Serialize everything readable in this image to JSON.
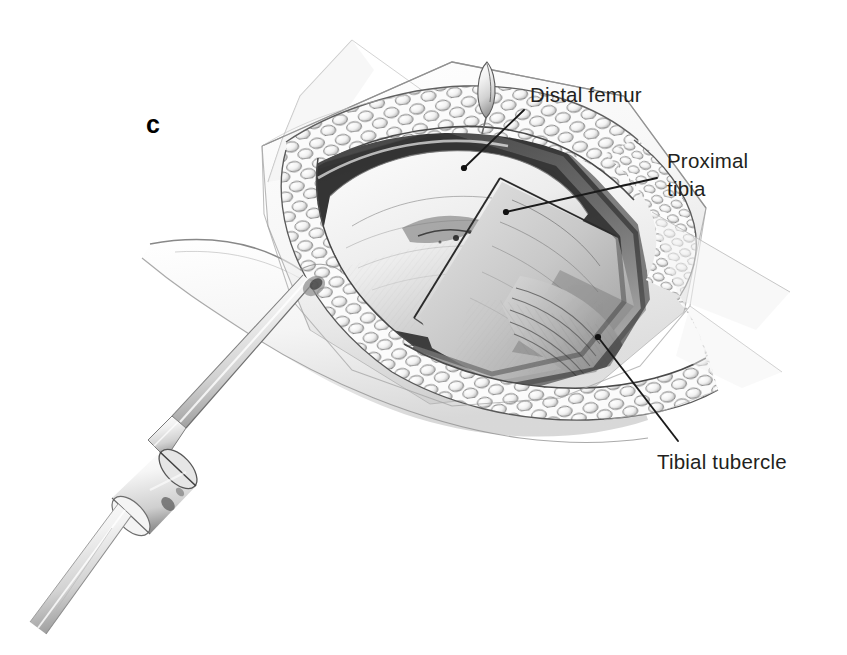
{
  "figure": {
    "type": "medical-surgical-illustration",
    "panel_letter": "c",
    "background_color": "#ffffff",
    "ink_color": "#231f20",
    "width": 847,
    "height": 655
  },
  "labels": [
    {
      "id": "distal-femur",
      "lines": [
        "Distal femur"
      ],
      "text_x": 530,
      "text_y": 102,
      "leader": {
        "x1": 524,
        "y1": 110,
        "x2": 464,
        "y2": 168
      },
      "dot": {
        "cx": 464,
        "cy": 168,
        "r": 3.1
      }
    },
    {
      "id": "proximal-tibia",
      "lines": [
        "Proximal",
        "tibia"
      ],
      "text_x": 667,
      "text_y": 168,
      "line_height": 28,
      "leader": {
        "x1": 657,
        "y1": 178,
        "x2": 506,
        "y2": 212
      },
      "dot": {
        "cx": 506,
        "cy": 212,
        "r": 3.1
      }
    },
    {
      "id": "tibial-tubercle",
      "lines": [
        "Tibial tubercle"
      ],
      "text_x": 657,
      "text_y": 469,
      "leader": {
        "x1": 678,
        "y1": 441,
        "x2": 598,
        "y2": 337
      },
      "dot": {
        "cx": 598,
        "cy": 337,
        "r": 3.1
      }
    }
  ],
  "anatomy_parts": [
    {
      "id": "skin-flap-upper",
      "name": "retracted skin flap (superior)"
    },
    {
      "id": "skin-flap-lower",
      "name": "retracted skin flap (inferior)"
    },
    {
      "id": "subcutaneous-fat",
      "name": "subcutaneous fat lobules at wound margin"
    },
    {
      "id": "distal-femur-surface",
      "name": "distal femoral articular surface"
    },
    {
      "id": "proximal-tibia-surface",
      "name": "proximal tibial plateau"
    },
    {
      "id": "patellar-tendon",
      "name": "patellar tendon fibres over tibial tubercle"
    },
    {
      "id": "leg-contour",
      "name": "lower leg skin contour"
    }
  ],
  "instruments": [
    {
      "id": "transfixion-pin",
      "name": "transfixion pin / Steinmann pin with chuck collar"
    },
    {
      "id": "pin-collar",
      "name": "pin chuck collar"
    },
    {
      "id": "blade-tip",
      "name": "small pointed blade tip at superior wound apex"
    }
  ]
}
